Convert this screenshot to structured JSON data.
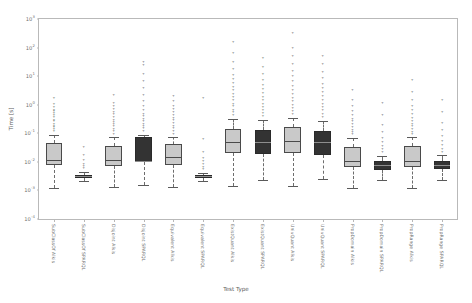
{
  "chart_data": {
    "type": "box",
    "title": "",
    "xlabel": "Test Type",
    "ylabel": "Time [s]",
    "yscale": "log",
    "ylim": [
      0.0001,
      1000
    ],
    "grid": false,
    "legend": null,
    "y_ticks": [
      {
        "value": 1000,
        "label": "10",
        "exp": "3"
      },
      {
        "value": 100,
        "label": "10",
        "exp": "2"
      },
      {
        "value": 10,
        "label": "10",
        "exp": "1"
      },
      {
        "value": 1,
        "label": "10",
        "exp": "0"
      },
      {
        "value": 0.1,
        "label": "10",
        "exp": "-1"
      },
      {
        "value": 0.01,
        "label": "10",
        "exp": "-2"
      },
      {
        "value": 0.001,
        "label": "10",
        "exp": "-3"
      },
      {
        "value": 0.0001,
        "label": "10",
        "exp": "-4"
      }
    ],
    "categories": [
      "SubClassOf Alkis",
      "SubClassOf SPARQL",
      "Disjoint Alkis",
      "Disjoint SPARQL",
      "Equivalent Alkis",
      "Equivalent SPARQL",
      "ExistQuant Alkis",
      "ExistQuant SPARQL",
      "UnivQuant Alkis",
      "UnivQuant SPARQL",
      "PropDomain Alkis",
      "PropDomain SPARQL",
      "PropRange Alkis",
      "PropRange SPARQL"
    ],
    "boxes": [
      {
        "category": "SubClassOf Alkis",
        "color": "light",
        "whislo": 0.0012,
        "q1": 0.0075,
        "med": 0.0115,
        "q3": 0.047,
        "whishi": 0.09,
        "fliers": [
          0.11,
          0.13,
          0.15,
          0.17,
          0.2,
          0.24,
          0.28,
          0.33,
          0.4,
          0.47,
          0.55,
          0.62,
          0.78,
          1.0,
          1.6
        ]
      },
      {
        "category": "SubClassOf SPARQL",
        "color": "dark",
        "whislo": 0.0022,
        "q1": 0.0028,
        "med": 0.0031,
        "q3": 0.0036,
        "whishi": 0.0045,
        "fliers": [
          0.0055,
          0.0065,
          0.008,
          0.011,
          0.016,
          0.03
        ]
      },
      {
        "category": "Disjoint Alkis",
        "color": "light",
        "whislo": 0.0013,
        "q1": 0.0072,
        "med": 0.0112,
        "q3": 0.036,
        "whishi": 0.075,
        "fliers": [
          0.09,
          0.11,
          0.13,
          0.16,
          0.19,
          0.23,
          0.28,
          0.34,
          0.42,
          0.52,
          0.65,
          0.85,
          1.1,
          2.0
        ]
      },
      {
        "category": "Disjoint SPARQL",
        "color": "dark",
        "whislo": 0.0016,
        "q1": 0.0095,
        "med": 0.0105,
        "q3": 0.072,
        "whishi": 0.09,
        "fliers": [
          0.11,
          0.14,
          0.17,
          0.2,
          0.25,
          0.3,
          0.36,
          0.45,
          0.6,
          0.8,
          1.2,
          2.0,
          3.5,
          6.0,
          11.0,
          22.0,
          30.0
        ]
      },
      {
        "category": "Equivalent Alkis",
        "color": "light",
        "whislo": 0.0013,
        "q1": 0.0078,
        "med": 0.0145,
        "q3": 0.041,
        "whishi": 0.075,
        "fliers": [
          0.09,
          0.11,
          0.14,
          0.17,
          0.21,
          0.26,
          0.32,
          0.4,
          0.5,
          0.65,
          0.85,
          1.2,
          1.9
        ]
      },
      {
        "category": "Equivalent SPARQL",
        "color": "dark",
        "whislo": 0.0021,
        "q1": 0.0028,
        "med": 0.0031,
        "q3": 0.0035,
        "whishi": 0.0042,
        "fliers": [
          0.005,
          0.006,
          0.0075,
          0.0095,
          0.013,
          0.02,
          0.06,
          1.6
        ]
      },
      {
        "category": "ExistQuant Alkis",
        "color": "light",
        "whislo": 0.0014,
        "q1": 0.02,
        "med": 0.05,
        "q3": 0.14,
        "whishi": 0.32,
        "fliers": [
          0.4,
          0.5,
          0.62,
          0.8,
          1.0,
          1.3,
          1.7,
          2.2,
          3.0,
          4.0,
          5.5,
          7.5,
          10.0,
          16.0,
          28.0,
          60.0,
          150.0
        ]
      },
      {
        "category": "ExistQuant SPARQL",
        "color": "dark",
        "whislo": 0.0024,
        "q1": 0.019,
        "med": 0.05,
        "q3": 0.13,
        "whishi": 0.3,
        "fliers": [
          0.38,
          0.48,
          0.6,
          0.78,
          1.0,
          1.3,
          1.7,
          2.3,
          3.2,
          4.5,
          7.0,
          11.0,
          20.0,
          40.0
        ]
      },
      {
        "category": "UnivQuant Alkis",
        "color": "light",
        "whislo": 0.0014,
        "q1": 0.021,
        "med": 0.055,
        "q3": 0.16,
        "whishi": 0.35,
        "fliers": [
          0.44,
          0.55,
          0.7,
          0.9,
          1.2,
          1.6,
          2.2,
          3.0,
          4.2,
          6.0,
          9.0,
          14.0,
          25.0,
          45.0,
          90.0,
          300.0
        ]
      },
      {
        "category": "UnivQuant SPARQL",
        "color": "dark",
        "whislo": 0.0025,
        "q1": 0.018,
        "med": 0.048,
        "q3": 0.125,
        "whishi": 0.28,
        "fliers": [
          0.35,
          0.45,
          0.58,
          0.75,
          1.0,
          1.35,
          1.8,
          2.5,
          3.5,
          5.0,
          8.0,
          13.0,
          24.0,
          48.0
        ]
      },
      {
        "category": "PropDomain Alkis",
        "color": "light",
        "whislo": 0.0012,
        "q1": 0.0065,
        "med": 0.0105,
        "q3": 0.033,
        "whishi": 0.07,
        "fliers": [
          0.085,
          0.1,
          0.125,
          0.15,
          0.19,
          0.24,
          0.3,
          0.4,
          0.55,
          0.8,
          1.3,
          3.0
        ]
      },
      {
        "category": "PropDomain SPARQL",
        "color": "dark",
        "whislo": 0.0023,
        "q1": 0.0052,
        "med": 0.0075,
        "q3": 0.0105,
        "whishi": 0.016,
        "fliers": [
          0.02,
          0.025,
          0.033,
          0.045,
          0.065,
          0.1,
          0.18,
          0.4,
          1.1
        ]
      },
      {
        "category": "PropRange Alkis",
        "color": "light",
        "whislo": 0.0012,
        "q1": 0.0068,
        "med": 0.011,
        "q3": 0.035,
        "whishi": 0.072,
        "fliers": [
          0.088,
          0.105,
          0.13,
          0.16,
          0.2,
          0.25,
          0.32,
          0.42,
          0.58,
          0.85,
          1.4,
          2.6,
          7.0
        ]
      },
      {
        "category": "PropRange SPARQL",
        "color": "dark",
        "whislo": 0.0024,
        "q1": 0.0055,
        "med": 0.0078,
        "q3": 0.011,
        "whishi": 0.017,
        "fliers": [
          0.021,
          0.027,
          0.035,
          0.05,
          0.075,
          0.12,
          0.22,
          0.5,
          1.4
        ]
      }
    ]
  },
  "colors": {
    "light_box": "#c9c9c9",
    "dark_box": "#333333",
    "edge": "#4a4a4a",
    "whisker": "#6d6d6d",
    "axis": "#b9b9b9",
    "tick_text": "#6f6f6f",
    "label_text": "#5e5e5e",
    "background": "#ffffff"
  }
}
